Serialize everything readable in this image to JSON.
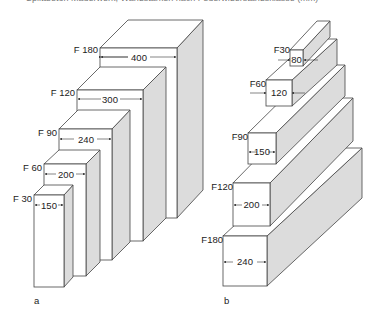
{
  "header": {
    "partial_text": "Splittbeton Mauerwerk; Wandstärken nach Feuerwiderstandsklasse (mm)"
  },
  "figure_a": {
    "caption": "a",
    "boxes": [
      {
        "label": "F 180",
        "width": "400"
      },
      {
        "label": "F 120",
        "width": "300"
      },
      {
        "label": "F 90",
        "width": "240"
      },
      {
        "label": "F 60",
        "width": "200"
      },
      {
        "label": "F 30",
        "width": "150"
      }
    ]
  },
  "figure_b": {
    "caption": "b",
    "walls": [
      {
        "label": "F30",
        "width": "80"
      },
      {
        "label": "F60",
        "width": "120"
      },
      {
        "label": "F90",
        "width": "150"
      },
      {
        "label": "F120",
        "width": "200"
      },
      {
        "label": "F180",
        "width": "240"
      }
    ]
  }
}
